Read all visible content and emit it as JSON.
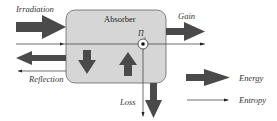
{
  "diagram": {
    "box_label": "Absorber",
    "entropy_source_label": "Π",
    "entropy_source_sub": "s",
    "flows": {
      "irradiation": "Irradiation",
      "reflection": "Reflection",
      "gain": "Gain",
      "loss": "Loss"
    },
    "legend": {
      "energy": "Energy",
      "entropy": "Entropy"
    },
    "colors": {
      "box_fill": "#d4d4d4",
      "box_stroke": "#555555",
      "arrow": "#4a4a4a",
      "line": "#333333"
    }
  }
}
